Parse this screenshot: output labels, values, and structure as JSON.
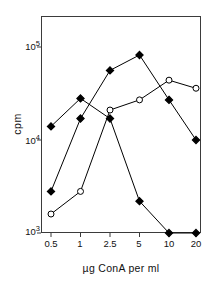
{
  "figure": {
    "cropped_caption_fragment": "",
    "background": "#ffffff",
    "frame_color": "#3b3b3b"
  },
  "axis": {
    "y_title": "cpm",
    "x_title": "µg ConA per ml",
    "y_ticks": [
      {
        "mantissa": "10",
        "exponent": "3",
        "value": 1000
      },
      {
        "mantissa": "10",
        "exponent": "4",
        "value": 10000
      },
      {
        "mantissa": "10",
        "exponent": "5",
        "value": 100000
      }
    ],
    "x_ticks": [
      "0.5",
      "1",
      "2.5",
      "5",
      "10",
      "20"
    ]
  },
  "chart_data": {
    "type": "line",
    "title": "",
    "subtitle": "",
    "xlabel": "µg ConA per ml",
    "ylabel": "cpm",
    "xscale": "category",
    "yscale": "log",
    "ylim": [
      1000,
      100000
    ],
    "grid": false,
    "legend": "none",
    "categories": [
      "0.5",
      "1",
      "2.5",
      "5",
      "10",
      "20"
    ],
    "series": [
      {
        "name": "filled-peak-early",
        "marker": "filled-diamond",
        "color": "#000000",
        "values": [
          14000,
          28000,
          17000,
          2200,
          1000,
          1000
        ],
        "note": "rises to peak at 1 µg then falls to baseline by 10 µg"
      },
      {
        "name": "filled-peak-mid",
        "marker": "filled-diamond",
        "color": "#000000",
        "values": [
          2800,
          17000,
          56000,
          82000,
          27000,
          10000
        ],
        "note": "broad peak at 5 µg, declines afterwards"
      },
      {
        "name": "open-rising",
        "marker": "open-circle",
        "color": "#000000",
        "values": [
          1600,
          2800,
          21000,
          27000,
          44000,
          36000
        ],
        "note": "monotonic rise, plateau at 10 µg"
      }
    ]
  }
}
